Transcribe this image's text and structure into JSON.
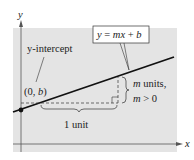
{
  "diagram": {
    "axes": {
      "x_label": "x",
      "y_label": "y"
    },
    "equation_box": {
      "text_parts": [
        "y",
        " = ",
        "mx",
        " + ",
        "b"
      ]
    },
    "intercept_label": "y-intercept",
    "intercept_point": {
      "open": "(0, ",
      "var": "b",
      "close": ")"
    },
    "run_label": "1 unit",
    "rise_label": {
      "line1_var": "m",
      "line1_text": " units,",
      "line2_var": "m",
      "line2_text": " > 0"
    },
    "colors": {
      "background": "#e4e4e4",
      "line": "#111111",
      "axis": "#555555"
    }
  }
}
